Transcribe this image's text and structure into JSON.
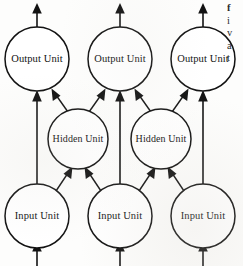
{
  "figure": {
    "type": "diagram",
    "subtype": "neural-network-architecture",
    "title": "",
    "background_color": "#fdfdfc",
    "ink_color": "#121212",
    "layers": [
      {
        "id": "output",
        "name": "output-layer",
        "label": "Output Unit",
        "nodes": [
          {
            "id": "out-1",
            "label": "Output Unit",
            "cx": 37,
            "cy": 59,
            "r": 32
          },
          {
            "id": "out-2",
            "label": "Output Unit",
            "cx": 120,
            "cy": 59,
            "r": 32
          },
          {
            "id": "out-3",
            "label": "Output Unit",
            "cx": 203,
            "cy": 59,
            "r": 32
          }
        ]
      },
      {
        "id": "hidden",
        "name": "hidden-layer",
        "label": "Hidden Unit",
        "nodes": [
          {
            "id": "hid-1",
            "label": "Hidden Unit",
            "cx": 78,
            "cy": 139,
            "r": 30
          },
          {
            "id": "hid-2",
            "label": "Hidden Unit",
            "cx": 161,
            "cy": 139,
            "r": 30
          }
        ]
      },
      {
        "id": "input",
        "name": "input-layer",
        "label": "Input Unit",
        "nodes": [
          {
            "id": "in-1",
            "label": "Input Unit",
            "cx": 37,
            "cy": 216,
            "r": 32
          },
          {
            "id": "in-2",
            "label": "Input Unit",
            "cx": 120,
            "cy": 216,
            "r": 32
          },
          {
            "id": "in-3",
            "label": "Input Unit",
            "cx": 203,
            "cy": 216,
            "r": 32
          }
        ]
      }
    ],
    "edges": [
      {
        "from": "external-in-1",
        "to": "in-1",
        "kind": "vertical",
        "arrow": "up"
      },
      {
        "from": "external-in-2",
        "to": "in-2",
        "kind": "vertical",
        "arrow": "up"
      },
      {
        "from": "external-in-3",
        "to": "in-3",
        "kind": "vertical",
        "arrow": "up"
      },
      {
        "from": "in-1",
        "to": "out-1",
        "kind": "vertical",
        "arrow": "up"
      },
      {
        "from": "in-2",
        "to": "out-2",
        "kind": "vertical",
        "arrow": "up"
      },
      {
        "from": "in-3",
        "to": "out-3",
        "kind": "vertical",
        "arrow": "up"
      },
      {
        "from": "in-1",
        "to": "hid-1",
        "kind": "diagonal",
        "arrow": "up-right"
      },
      {
        "from": "in-2",
        "to": "hid-1",
        "kind": "diagonal",
        "arrow": "up-left"
      },
      {
        "from": "in-2",
        "to": "hid-2",
        "kind": "diagonal",
        "arrow": "up-right"
      },
      {
        "from": "in-3",
        "to": "hid-2",
        "kind": "diagonal",
        "arrow": "up-left"
      },
      {
        "from": "hid-1",
        "to": "out-1",
        "kind": "diagonal",
        "arrow": "up-left"
      },
      {
        "from": "hid-1",
        "to": "out-2",
        "kind": "diagonal",
        "arrow": "up-right"
      },
      {
        "from": "hid-2",
        "to": "out-2",
        "kind": "diagonal",
        "arrow": "up-left"
      },
      {
        "from": "hid-2",
        "to": "out-3",
        "kind": "diagonal",
        "arrow": "up-right"
      },
      {
        "from": "out-1",
        "to": "external-out-1",
        "kind": "vertical",
        "arrow": "up"
      },
      {
        "from": "out-2",
        "to": "external-out-2",
        "kind": "vertical",
        "arrow": "up"
      },
      {
        "from": "out-3",
        "to": "external-out-3",
        "kind": "vertical",
        "arrow": "up"
      }
    ]
  },
  "margin_text": {
    "note": "partially cropped body-text column at right edge",
    "lines": [
      "f",
      "i",
      "v",
      "a",
      "t",
      "v"
    ]
  }
}
